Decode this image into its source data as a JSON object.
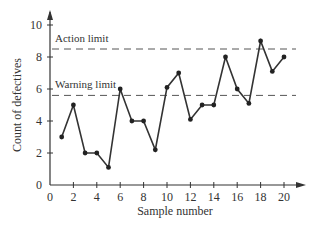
{
  "chart_data": {
    "type": "line",
    "title": "",
    "xlabel": "Sample number",
    "ylabel": "Count of defectives",
    "x": [
      1,
      2,
      3,
      4,
      5,
      6,
      7,
      8,
      9,
      10,
      11,
      12,
      13,
      14,
      15,
      16,
      17,
      18,
      19,
      20
    ],
    "series": [
      {
        "name": "Defectives",
        "values": [
          3,
          5,
          2,
          2,
          1.1,
          6,
          4,
          4,
          2.2,
          6.1,
          7,
          4.1,
          5,
          5,
          8,
          6,
          5.1,
          9,
          7.1,
          8
        ]
      }
    ],
    "xlim": [
      0,
      20
    ],
    "ylim": [
      0,
      10
    ],
    "xticks": [
      0,
      2,
      4,
      6,
      8,
      10,
      12,
      14,
      16,
      18,
      20
    ],
    "yticks": [
      0,
      2,
      4,
      6,
      8,
      10
    ],
    "reference_lines": [
      {
        "label": "Action limit",
        "value": 8.5
      },
      {
        "label": "Warning limit",
        "value": 5.6
      }
    ],
    "grid": false,
    "legend": "none"
  }
}
